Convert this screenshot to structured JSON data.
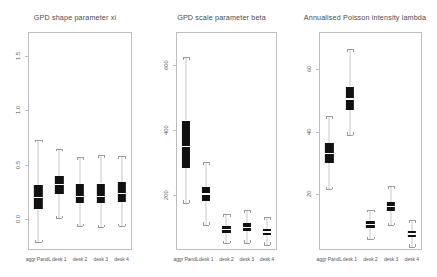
{
  "figure": {
    "categories": [
      "aggr PandL",
      "desk 1",
      "desk 2",
      "desk 3",
      "desk 4"
    ],
    "box_fill_color": "#111111",
    "median_color": "#ffffff",
    "whisker_color": "#c9c9c9",
    "frame_color": "#bdbdbd",
    "background": "#ffffff"
  },
  "chart_data": [
    {
      "type": "box",
      "title": "GPD shape parameter xi",
      "xlabel": "",
      "ylabel": "",
      "ylim": [
        -0.28,
        1.72
      ],
      "yticks": [
        0.0,
        0.5,
        1.0,
        1.5
      ],
      "ytick_labels": [
        "0.0",
        "0.5",
        "1.0",
        "1.5"
      ],
      "grid": false,
      "legend": "none",
      "categories": [
        "aggr PandL",
        "desk 1",
        "desk 2",
        "desk 3",
        "desk 4"
      ],
      "boxes": [
        {
          "category": "aggr PandL",
          "whisker_low": -0.21,
          "q1": 0.1,
          "median": 0.2,
          "q3": 0.32,
          "whisker_high": 0.73
        },
        {
          "category": "desk 1",
          "whisker_low": 0.01,
          "q1": 0.23,
          "median": 0.32,
          "q3": 0.4,
          "whisker_high": 0.65
        },
        {
          "category": "desk 2",
          "whisker_low": -0.06,
          "q1": 0.15,
          "median": 0.21,
          "q3": 0.33,
          "whisker_high": 0.57
        },
        {
          "category": "desk 3",
          "whisker_low": -0.07,
          "q1": 0.15,
          "median": 0.21,
          "q3": 0.33,
          "whisker_high": 0.59
        },
        {
          "category": "desk 4",
          "whisker_low": -0.06,
          "q1": 0.16,
          "median": 0.24,
          "q3": 0.34,
          "whisker_high": 0.58
        }
      ]
    },
    {
      "type": "box",
      "title": "GPD scale parameter beta",
      "xlabel": "",
      "ylabel": "",
      "ylim": [
        30,
        700
      ],
      "yticks": [
        200,
        400,
        600
      ],
      "ytick_labels": [
        "200",
        "400",
        "600"
      ],
      "grid": false,
      "legend": "none",
      "categories": [
        "aggr PandL",
        "desk 1",
        "desk 2",
        "desk 3",
        "desk 4"
      ],
      "boxes": [
        {
          "category": "aggr PandL",
          "whisker_low": 175,
          "q1": 283,
          "median": 348,
          "q3": 428,
          "whisker_high": 623
        },
        {
          "category": "desk 1",
          "whisker_low": 108,
          "q1": 181,
          "median": 203,
          "q3": 225,
          "whisker_high": 300
        },
        {
          "category": "desk 2",
          "whisker_low": 50,
          "q1": 82,
          "median": 93,
          "q3": 104,
          "whisker_high": 140
        },
        {
          "category": "desk 3",
          "whisker_low": 52,
          "q1": 87,
          "median": 99,
          "q3": 112,
          "whisker_high": 152
        },
        {
          "category": "desk 4",
          "whisker_low": 46,
          "q1": 76,
          "median": 86,
          "q3": 96,
          "whisker_high": 131
        }
      ]
    },
    {
      "type": "box",
      "title": "Annualised Poisson intensity lambda",
      "xlabel": "",
      "ylabel": "",
      "ylim": [
        2,
        72
      ],
      "yticks": [
        20,
        40,
        60
      ],
      "ytick_labels": [
        "20",
        "40",
        "60"
      ],
      "grid": false,
      "legend": "none",
      "categories": [
        "aggr PandL",
        "desk 1",
        "desk 2",
        "desk 3",
        "desk 4"
      ],
      "boxes": [
        {
          "category": "aggr PandL",
          "whisker_low": 21.5,
          "q1": 30.0,
          "median": 33.0,
          "q3": 36.5,
          "whisker_high": 45.0
        },
        {
          "category": "desk 1",
          "whisker_low": 39.0,
          "q1": 47.0,
          "median": 50.5,
          "q3": 54.5,
          "whisker_high": 66.5
        },
        {
          "category": "desk 2",
          "whisker_low": 5.5,
          "q1": 9.0,
          "median": 10.2,
          "q3": 11.3,
          "whisker_high": 15.0
        },
        {
          "category": "desk 3",
          "whisker_low": 10.0,
          "q1": 14.5,
          "median": 16.0,
          "q3": 17.5,
          "whisker_high": 22.5
        },
        {
          "category": "desk 4",
          "whisker_low": 3.0,
          "q1": 6.2,
          "median": 7.2,
          "q3": 8.2,
          "whisker_high": 11.5
        }
      ]
    }
  ]
}
